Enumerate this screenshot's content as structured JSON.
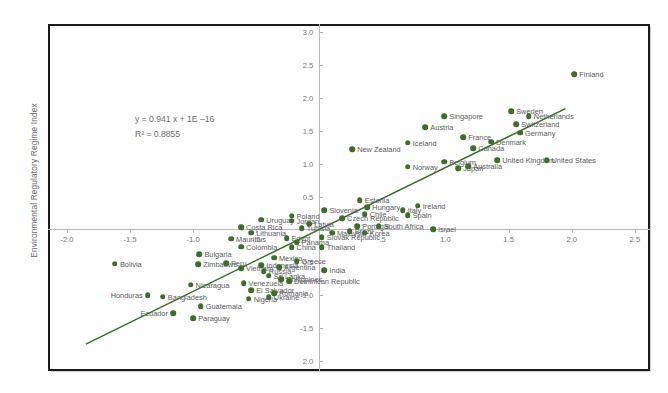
{
  "chart_data": {
    "type": "scatter",
    "title": "",
    "xlabel": "",
    "ylabel": "Environmental Regulatory Regime Index",
    "xlim": [
      -2.15,
      2.62
    ],
    "ylim": [
      -2.15,
      3.12
    ],
    "grid": false,
    "legend": null,
    "marker_color": "#3f6b2c",
    "trendline_color": "#3f6b2c",
    "annotations": {
      "equation": "y = 0.941 x + 1E –16",
      "r_squared": "R² = 0.8855"
    },
    "trendline": {
      "slope": 0.941,
      "intercept": 0.0,
      "x_from": -1.85,
      "x_to": 1.95
    },
    "xticks": [
      {
        "value": -2.0,
        "label": "-2.0"
      },
      {
        "value": -1.5,
        "label": "-1.5"
      },
      {
        "value": -1.0,
        "label": "-1.0"
      },
      {
        "value": -0.5,
        "label": "-.5"
      },
      {
        "value": 0.5,
        "label": ".5"
      },
      {
        "value": 1.0,
        "label": "1.0"
      },
      {
        "value": 1.5,
        "label": "1.5"
      },
      {
        "value": 2.0,
        "label": "2.0"
      },
      {
        "value": 2.5,
        "label": "2.5"
      }
    ],
    "yticks": [
      {
        "value": 3.0,
        "label": "3.0"
      },
      {
        "value": 2.5,
        "label": "2.5"
      },
      {
        "value": 2.0,
        "label": "2.0"
      },
      {
        "value": 1.5,
        "label": "1.5"
      },
      {
        "value": 1.0,
        "label": "1.0"
      },
      {
        "value": 0.5,
        "label": "0.5"
      },
      {
        "value": -0.5,
        "label": "0.5"
      },
      {
        "value": -1.0,
        "label": "-1.0"
      },
      {
        "value": -1.5,
        "label": "-1.5"
      },
      {
        "value": -2.0,
        "label": "2.0"
      }
    ],
    "points": [
      {
        "label": "Finland",
        "x": 2.02,
        "y": 2.36,
        "side": "right"
      },
      {
        "label": "Sweden",
        "x": 1.52,
        "y": 1.8,
        "side": "right"
      },
      {
        "label": "Netherlands",
        "x": 1.66,
        "y": 1.72,
        "side": "right"
      },
      {
        "label": "Singapore",
        "x": 0.99,
        "y": 1.72,
        "side": "right"
      },
      {
        "label": "Switzerland",
        "x": 1.56,
        "y": 1.6,
        "side": "right"
      },
      {
        "label": "Germany",
        "x": 1.59,
        "y": 1.47,
        "side": "right"
      },
      {
        "label": "Austria",
        "x": 0.84,
        "y": 1.55,
        "side": "right"
      },
      {
        "label": "France",
        "x": 1.14,
        "y": 1.4,
        "side": "right"
      },
      {
        "label": "Denmark",
        "x": 1.36,
        "y": 1.33,
        "side": "right"
      },
      {
        "label": "Iceland",
        "x": 0.7,
        "y": 1.32,
        "side": "right"
      },
      {
        "label": "Canada",
        "x": 1.22,
        "y": 1.23,
        "side": "right"
      },
      {
        "label": "New Zealand",
        "x": 0.26,
        "y": 1.22,
        "side": "right"
      },
      {
        "label": "United Kingdom",
        "x": 1.41,
        "y": 1.05,
        "side": "right"
      },
      {
        "label": "United States",
        "x": 1.8,
        "y": 1.05,
        "side": "right"
      },
      {
        "label": "Belgium",
        "x": 0.99,
        "y": 1.03,
        "side": "right"
      },
      {
        "label": "Australia",
        "x": 1.18,
        "y": 0.96,
        "side": "right"
      },
      {
        "label": "Japan",
        "x": 1.1,
        "y": 0.93,
        "side": "right"
      },
      {
        "label": "Norway",
        "x": 0.7,
        "y": 0.95,
        "side": "right"
      },
      {
        "label": "Ireland",
        "x": 0.78,
        "y": 0.36,
        "side": "right"
      },
      {
        "label": "Italy",
        "x": 0.66,
        "y": 0.29,
        "side": "right"
      },
      {
        "label": "Spain",
        "x": 0.7,
        "y": 0.22,
        "side": "right"
      },
      {
        "label": "Estonia",
        "x": 0.32,
        "y": 0.44,
        "side": "right"
      },
      {
        "label": "Hungary",
        "x": 0.38,
        "y": 0.34,
        "side": "right"
      },
      {
        "label": "Slovenia",
        "x": 0.04,
        "y": 0.29,
        "side": "right"
      },
      {
        "label": "Chile",
        "x": 0.36,
        "y": 0.23,
        "side": "right"
      },
      {
        "label": "Czech Republic",
        "x": 0.18,
        "y": 0.17,
        "side": "right"
      },
      {
        "label": "Poland",
        "x": -0.22,
        "y": 0.21,
        "side": "right"
      },
      {
        "label": "Uruguay",
        "x": -0.46,
        "y": 0.15,
        "side": "right"
      },
      {
        "label": "Jordan",
        "x": -0.22,
        "y": 0.13,
        "side": "right"
      },
      {
        "label": "Latvia",
        "x": -0.08,
        "y": 0.09,
        "side": "right"
      },
      {
        "label": "Portugal",
        "x": 0.3,
        "y": 0.05,
        "side": "right"
      },
      {
        "label": "South Africa",
        "x": 0.47,
        "y": 0.05,
        "side": "right"
      },
      {
        "label": "Costa Rica",
        "x": -0.62,
        "y": 0.03,
        "side": "right"
      },
      {
        "label": "Tunisia",
        "x": -0.14,
        "y": 0.02,
        "side": "right"
      },
      {
        "label": "Brazil",
        "x": 0.24,
        "y": -0.03,
        "side": "right"
      },
      {
        "label": "Korea",
        "x": 0.36,
        "y": -0.05,
        "side": "right"
      },
      {
        "label": "Malaysia",
        "x": 0.1,
        "y": -0.05,
        "side": "right"
      },
      {
        "label": "Lithuania",
        "x": -0.54,
        "y": -0.05,
        "side": "right"
      },
      {
        "label": "Slovak Republic",
        "x": 0.02,
        "y": -0.12,
        "side": "right"
      },
      {
        "label": "Egypt",
        "x": -0.26,
        "y": -0.13,
        "side": "right"
      },
      {
        "label": "Panama",
        "x": -0.18,
        "y": -0.19,
        "side": "right"
      },
      {
        "label": "Mauritius",
        "x": -0.7,
        "y": -0.14,
        "side": "right"
      },
      {
        "label": "Thailand",
        "x": 0.02,
        "y": -0.27,
        "side": "right"
      },
      {
        "label": "China",
        "x": -0.22,
        "y": -0.27,
        "side": "right"
      },
      {
        "label": "Colombia",
        "x": -0.62,
        "y": -0.26,
        "side": "right"
      },
      {
        "label": "Bulgaria",
        "x": -0.95,
        "y": -0.38,
        "side": "right"
      },
      {
        "label": "Mexico",
        "x": -0.36,
        "y": -0.43,
        "side": "right"
      },
      {
        "label": "Greece",
        "x": -0.18,
        "y": -0.48,
        "side": "right"
      },
      {
        "label": "Peru",
        "x": -0.74,
        "y": -0.51,
        "side": "right"
      },
      {
        "label": "Indonesia",
        "x": -0.46,
        "y": -0.54,
        "side": "right"
      },
      {
        "label": "Argentina",
        "x": -0.32,
        "y": -0.57,
        "side": "right"
      },
      {
        "label": "India",
        "x": 0.04,
        "y": -0.62,
        "side": "right"
      },
      {
        "label": "Zimbabwe",
        "x": -0.96,
        "y": -0.53,
        "side": "right"
      },
      {
        "label": "Vietnam",
        "x": -0.62,
        "y": -0.59,
        "side": "right"
      },
      {
        "label": "Russia",
        "x": -0.44,
        "y": -0.63,
        "side": "right"
      },
      {
        "label": "Sri Lanka",
        "x": -0.4,
        "y": -0.7,
        "side": "right"
      },
      {
        "label": "Philippines",
        "x": -0.3,
        "y": -0.76,
        "side": "right"
      },
      {
        "label": "Dominican Republic",
        "x": -0.24,
        "y": -0.79,
        "side": "right"
      },
      {
        "label": "Bolivia",
        "x": -1.62,
        "y": -0.52,
        "side": "right"
      },
      {
        "label": "Venezuela",
        "x": -0.6,
        "y": -0.82,
        "side": "right"
      },
      {
        "label": "Nicaragua",
        "x": -1.02,
        "y": -0.84,
        "side": "right"
      },
      {
        "label": "El Salvador",
        "x": -0.54,
        "y": -0.92,
        "side": "right"
      },
      {
        "label": "Romania",
        "x": -0.36,
        "y": -0.97,
        "side": "right"
      },
      {
        "label": "Ukraine",
        "x": -0.4,
        "y": -1.03,
        "side": "right"
      },
      {
        "label": "Nigeria",
        "x": -0.56,
        "y": -1.05,
        "side": "right"
      },
      {
        "label": "Bangladesh",
        "x": -1.24,
        "y": -1.02,
        "side": "right"
      },
      {
        "label": "Honduras",
        "x": -1.36,
        "y": -1.0,
        "side": "left"
      },
      {
        "label": "Guatemala",
        "x": -0.94,
        "y": -1.17,
        "side": "right"
      },
      {
        "label": "Paraguay",
        "x": -1.0,
        "y": -1.35,
        "side": "right"
      },
      {
        "label": "Ecuador",
        "x": -1.16,
        "y": -1.27,
        "side": "left"
      },
      {
        "label": "Israel",
        "x": 0.9,
        "y": 0.0,
        "side": "right"
      }
    ]
  }
}
